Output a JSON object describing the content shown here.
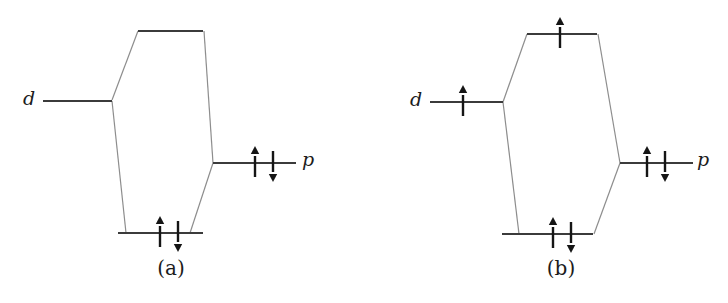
{
  "page": {
    "background_color": "#ffffff"
  },
  "figure": {
    "type": "orbital-energy-level-diagram",
    "colors": {
      "level_line": "#3b3b3b",
      "connector_line": "#8d8d8d",
      "electron_arrow": "#151515",
      "label_text": "#1c1c1c"
    },
    "diagrams": [
      {
        "caption": "(a)",
        "d_label": "d",
        "p_label": "p",
        "levels": [
          {
            "name": "antibonding-level",
            "x1": 138,
            "x2": 203,
            "y": 31,
            "electrons": []
          },
          {
            "name": "d-orbital-level",
            "x1": 43,
            "x2": 112,
            "y": 101,
            "electrons": []
          },
          {
            "name": "p-orbital-level",
            "x1": 213,
            "x2": 296,
            "y": 163,
            "electrons": [
              {
                "spin": "up",
                "x": 255
              },
              {
                "spin": "down",
                "x": 273
              }
            ]
          },
          {
            "name": "bonding-level",
            "x1": 118,
            "x2": 203,
            "y": 233,
            "electrons": [
              {
                "spin": "up",
                "x": 160
              },
              {
                "spin": "down",
                "x": 178
              }
            ]
          }
        ],
        "connectors": [
          {
            "x1": 112,
            "y1": 100,
            "x2": 138,
            "y2": 31
          },
          {
            "x1": 112,
            "y1": 101,
            "x2": 126,
            "y2": 233
          },
          {
            "x1": 213,
            "y1": 163,
            "x2": 204,
            "y2": 31
          },
          {
            "x1": 213,
            "y1": 163,
            "x2": 190,
            "y2": 233
          }
        ]
      },
      {
        "caption": "(b)",
        "d_label": "d",
        "p_label": "p",
        "levels": [
          {
            "name": "antibonding-level",
            "x1": 527,
            "x2": 597,
            "y": 34,
            "electrons": [
              {
                "spin": "up",
                "x": 560
              }
            ]
          },
          {
            "name": "d-orbital-level",
            "x1": 430,
            "x2": 503,
            "y": 102,
            "electrons": [
              {
                "spin": "up",
                "x": 463
              }
            ]
          },
          {
            "name": "p-orbital-level",
            "x1": 620,
            "x2": 693,
            "y": 163,
            "electrons": [
              {
                "spin": "up",
                "x": 647
              },
              {
                "spin": "down",
                "x": 665
              }
            ]
          },
          {
            "name": "bonding-level",
            "x1": 502,
            "x2": 593,
            "y": 234,
            "electrons": [
              {
                "spin": "up",
                "x": 553
              },
              {
                "spin": "down",
                "x": 571
              }
            ]
          }
        ],
        "connectors": [
          {
            "x1": 503,
            "y1": 102,
            "x2": 527,
            "y2": 34
          },
          {
            "x1": 503,
            "y1": 102,
            "x2": 519,
            "y2": 234
          },
          {
            "x1": 620,
            "y1": 163,
            "x2": 598,
            "y2": 34
          },
          {
            "x1": 620,
            "y1": 163,
            "x2": 594,
            "y2": 234
          }
        ]
      }
    ]
  }
}
